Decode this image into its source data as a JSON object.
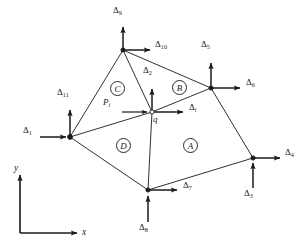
{
  "figure": {
    "type": "finite-element-mesh-diagram",
    "width": 308,
    "height": 245,
    "background_color": "#ffffff",
    "line_color": "#1a1a1a"
  },
  "axes": {
    "x_label": "x",
    "y_label": "y",
    "origin": {
      "x": 20,
      "y": 233
    },
    "x_end": {
      "x": 80,
      "y": 233
    },
    "y_end": {
      "x": 20,
      "y": 172
    }
  },
  "nodes": [
    {
      "id": "top",
      "name": "node-top",
      "x": 123,
      "y": 50,
      "label": ""
    },
    {
      "id": "left",
      "name": "node-left",
      "x": 70,
      "y": 137,
      "label": ""
    },
    {
      "id": "q",
      "name": "node-q",
      "x": 152,
      "y": 112,
      "label": "q"
    },
    {
      "id": "upper_right",
      "name": "node-upper-right",
      "x": 211,
      "y": 88,
      "label": ""
    },
    {
      "id": "right",
      "name": "node-far-right",
      "x": 253,
      "y": 158,
      "label": ""
    },
    {
      "id": "bottom",
      "name": "node-bottom",
      "x": 148,
      "y": 190,
      "label": ""
    }
  ],
  "edges": [
    {
      "from": "top",
      "to": "left"
    },
    {
      "from": "top",
      "to": "q"
    },
    {
      "from": "top",
      "to": "upper_right"
    },
    {
      "from": "left",
      "to": "q"
    },
    {
      "from": "left",
      "to": "bottom"
    },
    {
      "from": "q",
      "to": "upper_right"
    },
    {
      "from": "q",
      "to": "bottom"
    },
    {
      "from": "upper_right",
      "to": "right"
    },
    {
      "from": "bottom",
      "to": "right"
    }
  ],
  "regions": [
    {
      "id": "A",
      "label": "A",
      "x": 190,
      "y": 145
    },
    {
      "id": "B",
      "label": "B",
      "x": 179,
      "y": 87
    },
    {
      "id": "C",
      "label": "C",
      "x": 117,
      "y": 88
    },
    {
      "id": "D",
      "label": "D",
      "x": 123,
      "y": 145
    }
  ],
  "arrows": [
    {
      "id": "d1",
      "name": "arrow-delta-1",
      "symbol": "Δ",
      "subscript": "1",
      "subscript_italic": false,
      "node": "left",
      "direction": "right",
      "tail": {
        "x": 40,
        "y": 137
      },
      "head": {
        "x": 70,
        "y": 137
      },
      "label_pos": {
        "x": 23,
        "y": 131
      }
    },
    {
      "id": "d11",
      "name": "arrow-delta-11",
      "symbol": "Δ",
      "subscript": "11",
      "subscript_italic": false,
      "node": "left",
      "direction": "up",
      "tail": {
        "x": 70,
        "y": 137
      },
      "head": {
        "x": 70,
        "y": 107
      },
      "label_pos": {
        "x": 59,
        "y": 92
      }
    },
    {
      "id": "d9",
      "name": "arrow-delta-9",
      "symbol": "Δ",
      "subscript": "9",
      "subscript_italic": false,
      "node": "top",
      "direction": "up",
      "tail": {
        "x": 123,
        "y": 50
      },
      "head": {
        "x": 123,
        "y": 24
      },
      "label_pos": {
        "x": 114,
        "y": 10
      }
    },
    {
      "id": "d10",
      "name": "arrow-delta-10",
      "symbol": "Δ",
      "subscript": "10",
      "subscript_italic": false,
      "node": "top",
      "direction": "right",
      "tail": {
        "x": 123,
        "y": 50
      },
      "head": {
        "x": 153,
        "y": 50
      },
      "label_pos": {
        "x": 156,
        "y": 44
      }
    },
    {
      "id": "d2",
      "name": "arrow-delta-2",
      "symbol": "Δ",
      "subscript": "2",
      "subscript_italic": false,
      "node": "q",
      "direction": "up",
      "tail": {
        "x": 152,
        "y": 112
      },
      "head": {
        "x": 152,
        "y": 86
      },
      "label_pos": {
        "x": 145,
        "y": 70
      }
    },
    {
      "id": "di",
      "name": "arrow-delta-i",
      "symbol": "Δ",
      "subscript": "i",
      "subscript_italic": true,
      "node": "q",
      "direction": "right",
      "tail": {
        "x": 152,
        "y": 112
      },
      "head": {
        "x": 186,
        "y": 112
      },
      "label_pos": {
        "x": 190,
        "y": 107
      }
    },
    {
      "id": "pi",
      "name": "arrow-force-p-i",
      "symbol": "P",
      "subscript": "i",
      "subscript_italic": true,
      "symbol_italic": true,
      "node": "q",
      "direction": "right",
      "tail": {
        "x": 122,
        "y": 112
      },
      "head": {
        "x": 150,
        "y": 112
      },
      "label_pos": {
        "x": 105,
        "y": 102
      }
    },
    {
      "id": "d5",
      "name": "arrow-delta-5",
      "symbol": "Δ",
      "subscript": "5",
      "subscript_italic": false,
      "node": "upper_right",
      "direction": "up",
      "tail": {
        "x": 211,
        "y": 88
      },
      "head": {
        "x": 211,
        "y": 60
      },
      "label_pos": {
        "x": 203,
        "y": 44
      }
    },
    {
      "id": "d6",
      "name": "arrow-delta-6",
      "symbol": "Δ",
      "subscript": "6",
      "subscript_italic": false,
      "node": "upper_right",
      "direction": "right",
      "tail": {
        "x": 211,
        "y": 88
      },
      "head": {
        "x": 243,
        "y": 88
      },
      "label_pos": {
        "x": 247,
        "y": 82
      }
    },
    {
      "id": "d4",
      "name": "arrow-delta-4",
      "symbol": "Δ",
      "subscript": "4",
      "subscript_italic": false,
      "node": "right",
      "direction": "right",
      "tail": {
        "x": 253,
        "y": 158
      },
      "head": {
        "x": 283,
        "y": 158
      },
      "label_pos": {
        "x": 286,
        "y": 152
      }
    },
    {
      "id": "d3",
      "name": "arrow-delta-3",
      "symbol": "Δ",
      "subscript": "3",
      "subscript_italic": false,
      "node": "right",
      "direction": "up",
      "tail": {
        "x": 253,
        "y": 188
      },
      "head": {
        "x": 253,
        "y": 160
      },
      "label_pos": {
        "x": 245,
        "y": 190
      }
    },
    {
      "id": "d7",
      "name": "arrow-delta-7",
      "symbol": "Δ",
      "subscript": "7",
      "subscript_italic": false,
      "node": "bottom",
      "direction": "right",
      "tail": {
        "x": 148,
        "y": 190
      },
      "head": {
        "x": 180,
        "y": 190
      },
      "label_pos": {
        "x": 184,
        "y": 185
      }
    },
    {
      "id": "d8",
      "name": "arrow-delta-8",
      "symbol": "Δ",
      "subscript": "8",
      "subscript_italic": false,
      "node": "bottom",
      "direction": "up",
      "tail": {
        "x": 148,
        "y": 222
      },
      "head": {
        "x": 148,
        "y": 193
      },
      "label_pos": {
        "x": 140,
        "y": 224
      }
    }
  ]
}
